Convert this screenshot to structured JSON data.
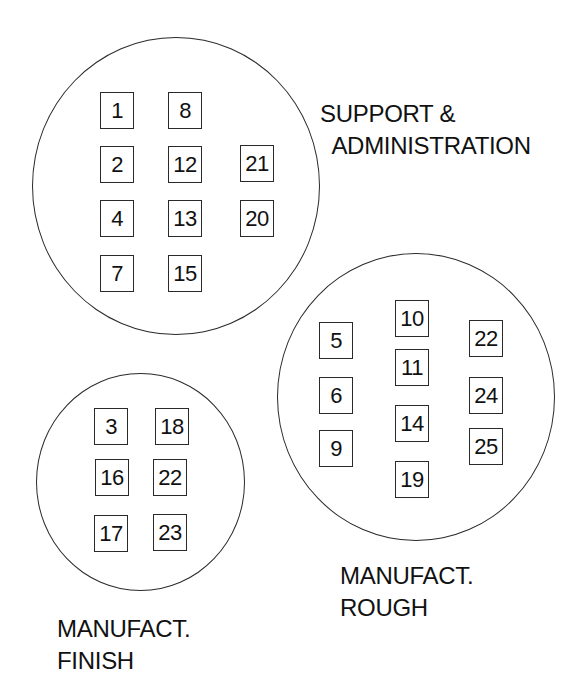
{
  "diagram": {
    "type": "cluster-grouping",
    "clusters": [
      {
        "id": "support-administration",
        "label_lines": [
          "SUPPORT &",
          "  ADMINISTRATION"
        ],
        "circle": {
          "left": 32,
          "top": 37,
          "width": 288,
          "height": 298
        },
        "label_pos": {
          "left": 320,
          "top": 98
        },
        "items": [
          {
            "label": "1",
            "x": 100,
            "y": 92
          },
          {
            "label": "8",
            "x": 168,
            "y": 92
          },
          {
            "label": "2",
            "x": 100,
            "y": 146
          },
          {
            "label": "12",
            "x": 168,
            "y": 146
          },
          {
            "label": "21",
            "x": 240,
            "y": 145
          },
          {
            "label": "4",
            "x": 100,
            "y": 200
          },
          {
            "label": "13",
            "x": 168,
            "y": 200
          },
          {
            "label": "20",
            "x": 240,
            "y": 200
          },
          {
            "label": "7",
            "x": 100,
            "y": 255
          },
          {
            "label": "15",
            "x": 168,
            "y": 255
          }
        ]
      },
      {
        "id": "manufact-rough",
        "label_lines": [
          "MANUFACT.",
          "ROUGH"
        ],
        "circle": {
          "left": 277,
          "top": 253,
          "width": 278,
          "height": 288
        },
        "label_pos": {
          "left": 340,
          "top": 560
        },
        "items": [
          {
            "label": "10",
            "x": 395,
            "y": 300
          },
          {
            "label": "5",
            "x": 319,
            "y": 322
          },
          {
            "label": "22",
            "x": 469,
            "y": 320
          },
          {
            "label": "11",
            "x": 395,
            "y": 349
          },
          {
            "label": "6",
            "x": 319,
            "y": 377
          },
          {
            "label": "24",
            "x": 469,
            "y": 377
          },
          {
            "label": "14",
            "x": 395,
            "y": 405
          },
          {
            "label": "9",
            "x": 319,
            "y": 430
          },
          {
            "label": "25",
            "x": 469,
            "y": 428
          },
          {
            "label": "19",
            "x": 395,
            "y": 461
          }
        ]
      },
      {
        "id": "manufact-finish",
        "label_lines": [
          "MANUFACT.",
          "FINISH"
        ],
        "circle": {
          "left": 36,
          "top": 373,
          "width": 209,
          "height": 218
        },
        "label_pos": {
          "left": 57,
          "top": 613
        },
        "items": [
          {
            "label": "3",
            "x": 94,
            "y": 408
          },
          {
            "label": "18",
            "x": 155,
            "y": 408
          },
          {
            "label": "16",
            "x": 95,
            "y": 459
          },
          {
            "label": "22",
            "x": 153,
            "y": 459
          },
          {
            "label": "17",
            "x": 94,
            "y": 515
          },
          {
            "label": "23",
            "x": 153,
            "y": 514
          }
        ]
      }
    ],
    "colors": {
      "stroke": "#2a2a2a",
      "text": "#111111",
      "background": "#ffffff"
    }
  }
}
